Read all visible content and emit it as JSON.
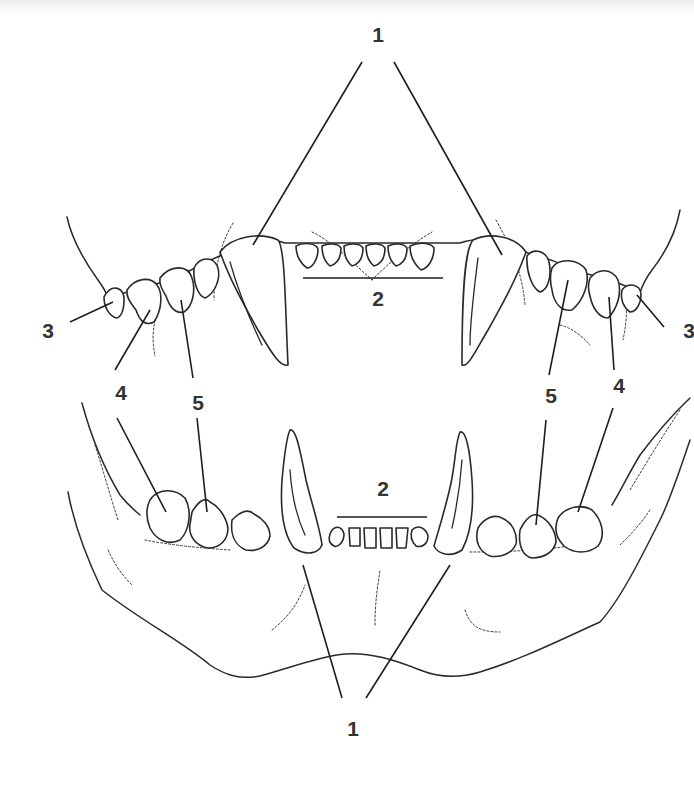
{
  "diagram": {
    "labels": {
      "upper_canines": "1",
      "upper_incisors": "2",
      "upper_left_molar": "3",
      "upper_right_molar": "3",
      "upper_left_carnassial": "4",
      "upper_right_carnassial": "4",
      "upper_left_premolar": "5",
      "upper_right_premolar": "5",
      "lower_left_carnassial": "4",
      "lower_right_carnassial": "4",
      "lower_left_premolar": "5",
      "lower_right_premolar": "5",
      "lower_incisors": "2",
      "lower_canines": "1"
    },
    "legend_meaning": {
      "1": "canine teeth",
      "2": "incisors",
      "3": "molars",
      "4": "carnassial teeth",
      "5": "premolars"
    },
    "colors": {
      "line": "#2a2a2a",
      "label": "#333333",
      "background": "#ffffff"
    }
  }
}
